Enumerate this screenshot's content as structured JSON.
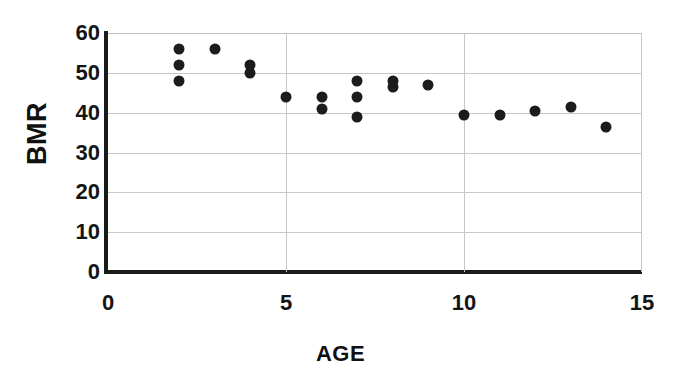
{
  "chart_data": {
    "type": "scatter",
    "title": "",
    "xlabel": "AGE",
    "ylabel": "BMR",
    "xlim": [
      0,
      15
    ],
    "ylim": [
      0,
      60
    ],
    "xticks": [
      "0",
      "5",
      "10",
      "15"
    ],
    "xtick_values": [
      0,
      5,
      10,
      15
    ],
    "yticks": [
      "0",
      "10",
      "20",
      "30",
      "40",
      "50",
      "60"
    ],
    "ytick_values": [
      0,
      10,
      20,
      30,
      40,
      50,
      60
    ],
    "grid": true,
    "grid_axis": "both",
    "legend": "none",
    "marker": "filled-circle",
    "marker_color": "#1c1c1c",
    "grid_color": "#c8c8c8",
    "axis_color": "#1a1a1a",
    "series": [
      {
        "name": "BMR vs AGE",
        "x": [
          2,
          2,
          2,
          3,
          4,
          4,
          5,
          6,
          6,
          7,
          7,
          7,
          8,
          8,
          9,
          10,
          11,
          12,
          13,
          14
        ],
        "y": [
          56,
          52,
          48,
          56,
          52,
          50,
          44,
          44,
          41,
          48,
          44,
          39,
          48,
          46.5,
          47,
          39.5,
          39.5,
          40.5,
          41.5,
          36.5
        ]
      }
    ],
    "points": [
      {
        "x": 2,
        "y": 56
      },
      {
        "x": 2,
        "y": 52
      },
      {
        "x": 2,
        "y": 48
      },
      {
        "x": 3,
        "y": 56
      },
      {
        "x": 4,
        "y": 52
      },
      {
        "x": 4,
        "y": 50
      },
      {
        "x": 5,
        "y": 44
      },
      {
        "x": 6,
        "y": 44
      },
      {
        "x": 6,
        "y": 41
      },
      {
        "x": 7,
        "y": 48
      },
      {
        "x": 7,
        "y": 44
      },
      {
        "x": 7,
        "y": 39
      },
      {
        "x": 8,
        "y": 48
      },
      {
        "x": 8,
        "y": 46.5
      },
      {
        "x": 9,
        "y": 47
      },
      {
        "x": 10,
        "y": 39.5
      },
      {
        "x": 11,
        "y": 39.5
      },
      {
        "x": 12,
        "y": 40.5
      },
      {
        "x": 13,
        "y": 41.5
      },
      {
        "x": 14,
        "y": 36.5
      }
    ]
  }
}
